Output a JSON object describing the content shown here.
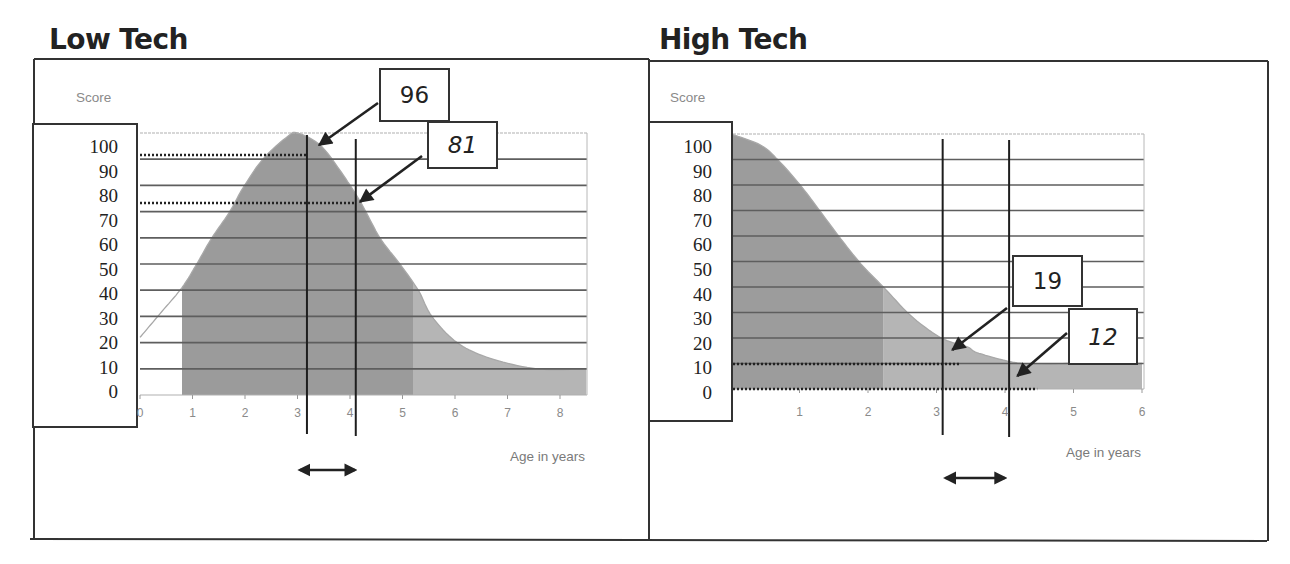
{
  "chart_data": [
    {
      "type": "area",
      "title": "Low Tech",
      "ylabel": "Score",
      "xlabel": "Age in years",
      "x_ticks": [
        "0",
        "1",
        "2",
        "3",
        "4",
        "5",
        "6",
        "7",
        "8"
      ],
      "y_ticks": [
        "100",
        "90",
        "80",
        "70",
        "60",
        "50",
        "40",
        "30",
        "20",
        "10",
        "0"
      ],
      "xlim": [
        0,
        8.5
      ],
      "ylim": [
        0,
        100
      ],
      "grid": true,
      "legend": "none",
      "series": [
        {
          "name": "Score",
          "x": [
            0,
            0.38,
            0.8,
            1.08,
            1.37,
            1.71,
            1.96,
            2.34,
            2.8,
            3.0,
            3.43,
            3.8,
            4.19,
            4.57,
            4.95,
            5.3,
            5.56,
            6.04,
            6.67,
            7.56,
            8.5
          ],
          "y": [
            22,
            31,
            41,
            50,
            60,
            70,
            79,
            90,
            98.5,
            100,
            95.4,
            86,
            74,
            60,
            50,
            40,
            30,
            20,
            14,
            10,
            10
          ]
        }
      ],
      "shaded_range": [
        0.8,
        8.5
      ],
      "shade_break_x": 5.2,
      "vertical_markers": [
        3.18,
        4.11
      ],
      "interval_arrow": [
        2.99,
        4.15
      ],
      "reference_lines": [
        {
          "y": 91.6,
          "x_end": 3.18
        },
        {
          "y": 73.3,
          "x_end": 4.11
        }
      ],
      "callouts": [
        {
          "label": "96",
          "italic": false,
          "points_to": {
            "x": 3.41,
            "y": 95.4
          }
        },
        {
          "label": "81",
          "italic": true,
          "points_to": {
            "x": 4.19,
            "y": 73.7
          }
        }
      ],
      "colors": {
        "fill_dark": "#9b9b9b",
        "fill_light": "#b5b5b5",
        "grid": "#5e5e5e",
        "curve": "#a8a8a8",
        "annotation": "#222222"
      }
    },
    {
      "type": "area",
      "title": "High Tech",
      "ylabel": "Score",
      "xlabel": "Age in years",
      "x_ticks": [
        "1",
        "2",
        "3",
        "4",
        "5",
        "6"
      ],
      "y_ticks": [
        "100",
        "90",
        "80",
        "70",
        "60",
        "50",
        "40",
        "30",
        "20",
        "10",
        "0"
      ],
      "xlim": [
        0,
        6
      ],
      "ylim": [
        0,
        100
      ],
      "grid": true,
      "legend": "none",
      "series": [
        {
          "name": "Score",
          "x": [
            0,
            0.43,
            0.68,
            1.01,
            1.31,
            1.6,
            1.9,
            2.26,
            2.63,
            3.07,
            3.45,
            3.62,
            4.25,
            5.0,
            6.0
          ],
          "y": [
            100,
            95.7,
            90,
            80,
            69.4,
            59,
            49,
            39,
            28.6,
            20,
            16.5,
            14,
            10,
            10,
            10
          ]
        }
      ],
      "shaded_range": [
        0,
        6
      ],
      "shade_break_x": 2.22,
      "vertical_markers": [
        3.09,
        4.06
      ],
      "interval_arrow": [
        3.09,
        4.04
      ],
      "reference_lines": [
        {
          "y": 9.8,
          "x_end": 3.34
        },
        {
          "y": 0,
          "x_end": 4.47
        }
      ],
      "callouts": [
        {
          "label": "19",
          "italic": false,
          "points_to": {
            "x": 3.23,
            "y": 15.3
          }
        },
        {
          "label": "12",
          "italic": true,
          "points_to": {
            "x": 4.18,
            "y": 5.1
          }
        }
      ],
      "colors": {
        "fill_dark": "#9c9c9c",
        "fill_light": "#b5b5b5",
        "grid": "#5e5e5e",
        "curve": "#a8a8a8",
        "annotation": "#222222"
      }
    }
  ]
}
